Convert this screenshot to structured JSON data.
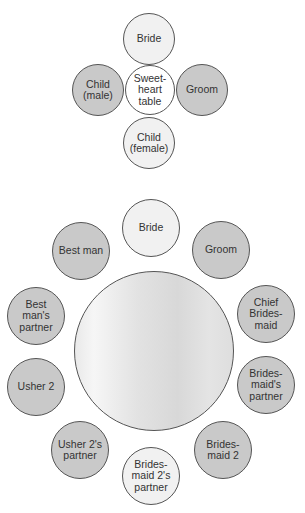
{
  "sweetheart_layout": {
    "table": {
      "label": "Sweet-\nheart\ntable",
      "cx": 150,
      "cy": 90,
      "r": 25,
      "fill": "white"
    },
    "seats": [
      {
        "label": "Bride",
        "cx": 149,
        "cy": 39,
        "r": 26,
        "fill": "light"
      },
      {
        "label": "Child\n(male)",
        "cx": 98,
        "cy": 90,
        "r": 26,
        "fill": "dark"
      },
      {
        "label": "Groom",
        "cx": 202,
        "cy": 90,
        "r": 26,
        "fill": "dark"
      },
      {
        "label": "Child\n(female)",
        "cx": 149,
        "cy": 143,
        "r": 26,
        "fill": "light"
      }
    ]
  },
  "round_table_layout": {
    "table": {
      "label": "",
      "cx": 154,
      "cy": 351,
      "r": 80
    },
    "seats": [
      {
        "label": "Bride",
        "cx": 151,
        "cy": 228,
        "r": 29,
        "fill": "light"
      },
      {
        "label": "Groom",
        "cx": 221,
        "cy": 250,
        "r": 29,
        "fill": "dark"
      },
      {
        "label": "Chief\nBrides-\nmaid",
        "cx": 266,
        "cy": 314,
        "r": 29,
        "fill": "dark"
      },
      {
        "label": "Brides-\nmaid's\npartner",
        "cx": 266,
        "cy": 385,
        "r": 29,
        "fill": "dark"
      },
      {
        "label": "Brides-\nmaid 2",
        "cx": 223,
        "cy": 450,
        "r": 29,
        "fill": "dark"
      },
      {
        "label": "Brides-\nmaid 2's\npartner",
        "cx": 151,
        "cy": 476,
        "r": 29,
        "fill": "light"
      },
      {
        "label": "Usher 2's\npartner",
        "cx": 80,
        "cy": 450,
        "r": 29,
        "fill": "dark"
      },
      {
        "label": "Usher 2",
        "cx": 36,
        "cy": 387,
        "r": 29,
        "fill": "dark"
      },
      {
        "label": "Best\nman's\npartner",
        "cx": 36,
        "cy": 316,
        "r": 29,
        "fill": "dark"
      },
      {
        "label": "Best man",
        "cx": 81,
        "cy": 251,
        "r": 29,
        "fill": "dark"
      }
    ]
  },
  "colors": {
    "light": "#f1f1f1",
    "dark": "#c9c9c9",
    "white": "#ffffff",
    "outline": "#555555",
    "text": "#333333"
  }
}
